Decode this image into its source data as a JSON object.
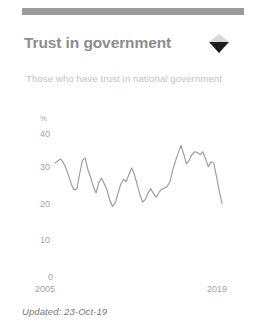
{
  "card": {
    "title": "Trust in government",
    "subtitle": "Those who have trust in national government",
    "toggle_icon": "collapse-expand-diamond-icon",
    "footer": "Updated: 23-Oct-19",
    "accent_bar_color": "#9b9b9b",
    "title_color": "#8d8d8d",
    "line_color": "#9a9a9a",
    "axis_text_color": "#a5a5a5"
  },
  "chart_data": {
    "type": "line",
    "title": "Trust in government",
    "subtitle": "Those who have trust in national government",
    "xlabel": "",
    "ylabel": "%",
    "unit": "%",
    "xlim": [
      2005,
      2019
    ],
    "ylim": [
      0,
      40
    ],
    "yticks": [
      0,
      10,
      20,
      30,
      40
    ],
    "xticks": [
      2005,
      2019
    ],
    "xtick_labels": [
      "2005",
      "2019"
    ],
    "grid": false,
    "legend": false,
    "series": [
      {
        "name": "Trust in national government",
        "values": [
          31.8,
          32.4,
          33.0,
          32.0,
          30.4,
          28.2,
          25.8,
          24.2,
          24.6,
          28.8,
          32.6,
          33.2,
          30.0,
          27.8,
          25.2,
          23.4,
          26.3,
          27.6,
          26.0,
          24.2,
          21.4,
          19.6,
          20.6,
          23.2,
          25.8,
          27.2,
          26.6,
          28.6,
          30.4,
          28.6,
          25.8,
          23.0,
          20.8,
          21.6,
          23.4,
          24.6,
          23.2,
          22.2,
          23.6,
          24.4,
          24.8,
          25.2,
          26.6,
          29.8,
          32.4,
          34.6,
          36.8,
          34.4,
          31.6,
          32.6,
          34.2,
          35.0,
          34.8,
          34.2,
          35.0,
          33.0,
          30.8,
          32.2,
          31.8,
          28.0,
          24.0,
          20.4
        ]
      }
    ]
  }
}
